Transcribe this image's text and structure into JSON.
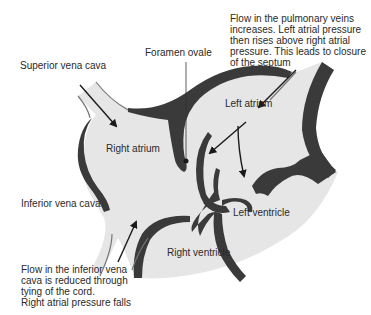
{
  "diagram": {
    "colors": {
      "chamber_fill": "#e6e6e6",
      "wall": "#3a3a3a",
      "text": "#2a2a2a",
      "background": "#ffffff"
    },
    "labels": {
      "superior_vena_cava": "Superior vena cava",
      "foramen_ovale": "Foramen ovale",
      "pulmonary_note": "Flow in the pulmonary veins\nincreases. Left atrial pressure\nthen rises above right atrial\npressure. This leads to closure\nof the septum",
      "left_atrium": "Left atrium",
      "right_atrium": "Right atrium",
      "inferior_vena_cava": "Inferior vena cava",
      "left_ventricle": "Left ventricle",
      "right_ventricle": "Right ventricle",
      "ivc_note": "Flow in the inferior vena\ncava is reduced through\ntying of the cord.\nRight atrial pressure falls"
    },
    "arrows": [
      {
        "name": "svc-flow",
        "from": "superior vena cava",
        "to": "right atrium"
      },
      {
        "name": "ivc-flow",
        "from": "inferior vena cava",
        "to": "right atrium"
      },
      {
        "name": "pulmonary-flow",
        "from": "pulmonary veins",
        "to": "left atrium"
      },
      {
        "name": "la-to-septum",
        "from": "left atrium",
        "to": "septum"
      },
      {
        "name": "la-to-lv",
        "from": "left atrium",
        "to": "left ventricle"
      }
    ]
  }
}
